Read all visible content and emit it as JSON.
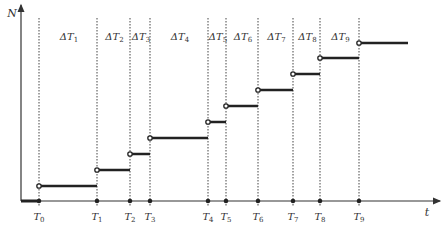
{
  "diagram": {
    "y_axis_label": "N",
    "x_axis_label": "t",
    "time_points": [
      {
        "label": "T",
        "sub": "0",
        "x": 39
      },
      {
        "label": "T",
        "sub": "1",
        "x": 97
      },
      {
        "label": "T",
        "sub": "2",
        "x": 130
      },
      {
        "label": "T",
        "sub": "3",
        "x": 150
      },
      {
        "label": "T",
        "sub": "4",
        "x": 208
      },
      {
        "label": "T",
        "sub": "5",
        "x": 226
      },
      {
        "label": "T",
        "sub": "6",
        "x": 258
      },
      {
        "label": "T",
        "sub": "7",
        "x": 293
      },
      {
        "label": "T",
        "sub": "8",
        "x": 320
      },
      {
        "label": "T",
        "sub": "9",
        "x": 359
      }
    ],
    "intervals": [
      {
        "label": "ΔT",
        "sub": "1"
      },
      {
        "label": "ΔT",
        "sub": "2"
      },
      {
        "label": "ΔT",
        "sub": "3"
      },
      {
        "label": "ΔT",
        "sub": "4"
      },
      {
        "label": "ΔT",
        "sub": "5"
      },
      {
        "label": "ΔT",
        "sub": "6"
      },
      {
        "label": "ΔT",
        "sub": "7"
      },
      {
        "label": "ΔT",
        "sub": "8"
      },
      {
        "label": "ΔT",
        "sub": "9"
      }
    ],
    "step_levels_y": [
      186,
      170,
      154,
      138,
      122,
      106,
      90,
      74,
      58,
      43
    ],
    "colors": {
      "axis": "#333333",
      "step": "#222222",
      "guide": "#444444"
    }
  }
}
